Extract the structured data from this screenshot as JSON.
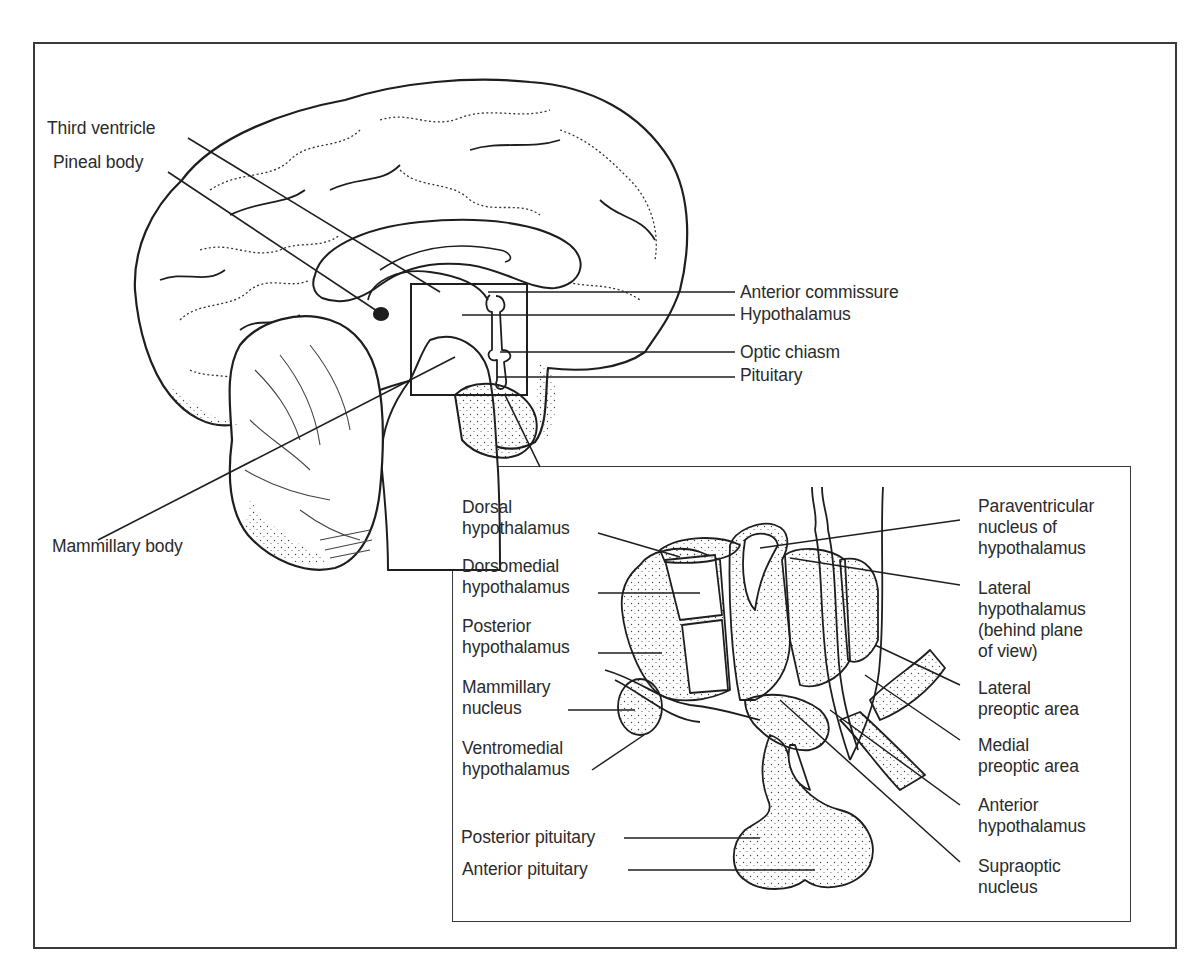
{
  "figure": {
    "colors": {
      "ink": "#1e1e1e",
      "text": "#2b2b2b",
      "frame": "#3a3a3a",
      "background": "#ffffff"
    }
  },
  "brain_labels": {
    "third_ventricle": "Third ventricle",
    "pineal_body": "Pineal body",
    "mammillary_body": "Mammillary body",
    "anterior_commissure": "Anterior commissure",
    "hypothalamus": "Hypothalamus",
    "optic_chiasm": "Optic chiasm",
    "pituitary": "Pituitary"
  },
  "inset_labels_left": [
    {
      "id": "dorsal-hypothalamus",
      "lines": [
        "Dorsal",
        "hypothalamus"
      ]
    },
    {
      "id": "dorsomedial-hypothalamus",
      "lines": [
        "Dorsomedial",
        "hypothalamus"
      ]
    },
    {
      "id": "posterior-hypothalamus",
      "lines": [
        "Posterior",
        "hypothalamus"
      ]
    },
    {
      "id": "mammillary-nucleus",
      "lines": [
        "Mammillary",
        "nucleus"
      ]
    },
    {
      "id": "ventromedial-hypothalamus",
      "lines": [
        "Ventromedial",
        "hypothalamus"
      ]
    },
    {
      "id": "posterior-pituitary",
      "lines": [
        "Posterior pituitary"
      ]
    },
    {
      "id": "anterior-pituitary",
      "lines": [
        "Anterior pituitary"
      ]
    }
  ],
  "inset_labels_right": [
    {
      "id": "paraventricular-nucleus",
      "lines": [
        "Paraventricular",
        "nucleus of",
        "hypothalamus"
      ]
    },
    {
      "id": "lateral-hypothalamus",
      "lines": [
        "Lateral",
        "hypothalamus",
        "(behind plane",
        "of view)"
      ]
    },
    {
      "id": "lateral-preoptic-area",
      "lines": [
        "Lateral",
        "preoptic area"
      ]
    },
    {
      "id": "medial-preoptic-area",
      "lines": [
        "Medial",
        "preoptic area"
      ]
    },
    {
      "id": "anterior-hypothalamus",
      "lines": [
        "Anterior",
        "hypothalamus"
      ]
    },
    {
      "id": "supraoptic-nucleus",
      "lines": [
        "Supraoptic",
        "nucleus"
      ]
    }
  ]
}
